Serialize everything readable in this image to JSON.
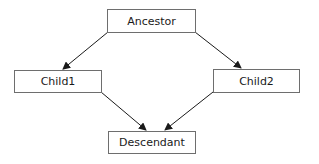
{
  "diagram": {
    "type": "inheritance-diamond",
    "nodes": [
      {
        "id": "ancestor",
        "label": "Ancestor"
      },
      {
        "id": "child1",
        "label": "Child1"
      },
      {
        "id": "child2",
        "label": "Child2"
      },
      {
        "id": "descendant",
        "label": "Descendant"
      }
    ],
    "edges": [
      {
        "from": "Ancestor",
        "to": "Child1"
      },
      {
        "from": "Ancestor",
        "to": "Child2"
      },
      {
        "from": "Child1",
        "to": "Descendant"
      },
      {
        "from": "Child2",
        "to": "Descendant"
      }
    ],
    "colors": {
      "border": "#6e6e6e",
      "arrow": "#1a1a1a",
      "background": "#ffffff"
    }
  }
}
